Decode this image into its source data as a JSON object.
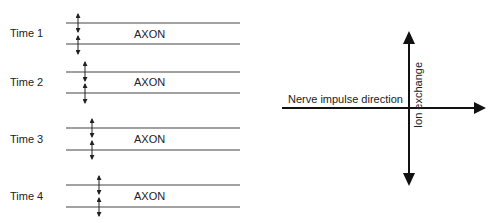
{
  "panels": [
    {
      "time_label": "Time 1",
      "axon_label": "AXON",
      "top_y": 23,
      "bottom_y": 44,
      "arrow_x": 78
    },
    {
      "time_label": "Time 2",
      "axon_label": "AXON",
      "top_y": 72,
      "bottom_y": 93,
      "arrow_x": 85
    },
    {
      "time_label": "Time 3",
      "axon_label": "AXON",
      "top_y": 128,
      "bottom_y": 150,
      "arrow_x": 92
    },
    {
      "time_label": "Time 4",
      "axon_label": "AXON",
      "top_y": 185,
      "bottom_y": 207,
      "arrow_x": 99
    }
  ],
  "axes": {
    "horizontal_label": "Nerve impulse direction",
    "vertical_label": "Ion exchange"
  },
  "colors": {
    "line": "#333333",
    "text": "#222222"
  }
}
